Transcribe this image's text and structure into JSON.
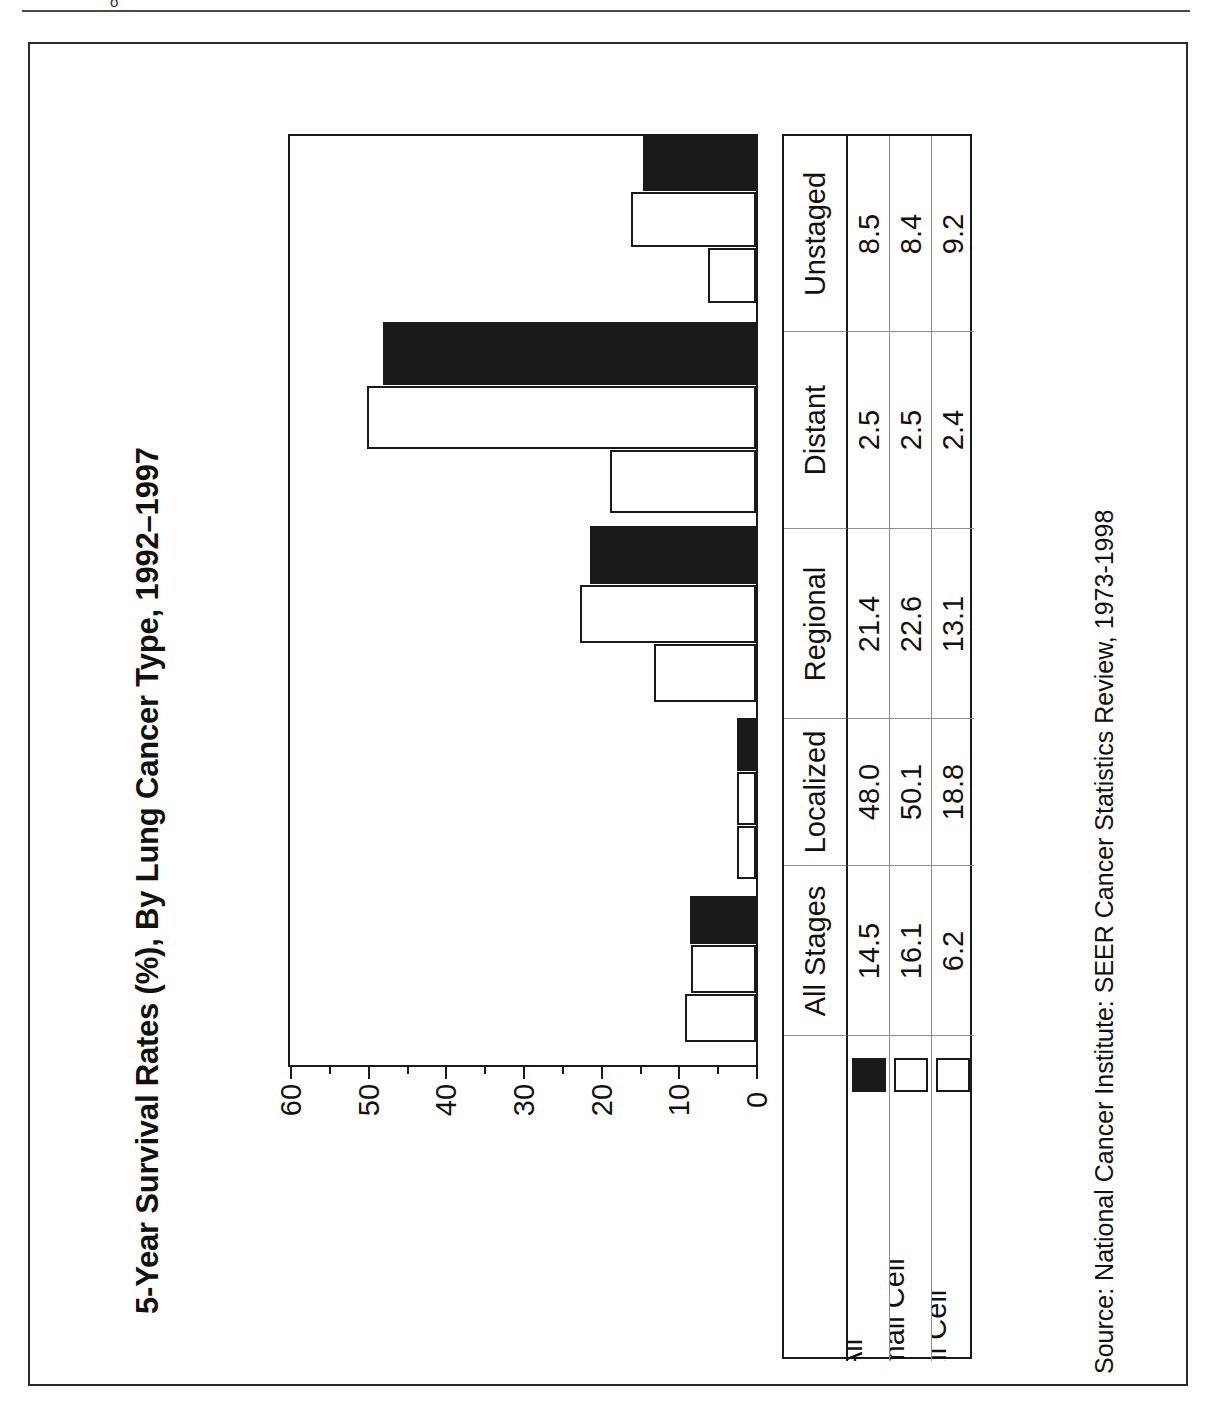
{
  "page": {
    "header_partial_text": "o",
    "background_color": "#ffffff",
    "frame_color": "#2b2b2b"
  },
  "chart_data": {
    "type": "bar",
    "orientation": "horizontal",
    "title": "5-Year Survival Rates (%), By Lung Cancer Type, 1992–1997",
    "xlabel": "",
    "ylabel": "",
    "categories": [
      "All Stages",
      "Localized",
      "Regional",
      "Distant",
      "Unstaged"
    ],
    "series": [
      {
        "name": "All",
        "fill": "solid",
        "color": "#1a1a1a",
        "values": [
          14.5,
          48.0,
          21.4,
          2.5,
          8.5
        ]
      },
      {
        "name": "Non-Small Cell",
        "fill": "hollow",
        "color": "#ffffff",
        "values": [
          16.1,
          50.1,
          22.6,
          2.5,
          8.4
        ]
      },
      {
        "name": "Small Cell",
        "fill": "hollow",
        "color": "#ffffff",
        "values": [
          6.2,
          18.8,
          13.1,
          2.4,
          9.2
        ]
      }
    ],
    "axis": {
      "ticks": [
        60,
        50,
        40,
        30,
        20,
        10,
        0
      ],
      "tick_labels": [
        "60",
        "50",
        "40",
        "30",
        "20",
        "10",
        "0"
      ],
      "minor_tick_step": 5,
      "range": [
        0,
        60
      ],
      "direction": "descending-left-to-right"
    },
    "grid": false,
    "legend_position": "table-row-headers",
    "source": "Source: National Cancer Institute: SEER Cancer Statistics Review, 1973-1998"
  },
  "table": {
    "corner_label": "",
    "column_headers": [
      "All Stages",
      "Localized",
      "Regional",
      "Distant",
      "Unstaged"
    ],
    "rows": [
      {
        "label": "All",
        "swatch": "solid",
        "values": [
          "14.5",
          "48.0",
          "21.4",
          "2.5",
          "8.5"
        ]
      },
      {
        "label": "Non-Small Cell",
        "swatch": "hollow",
        "values": [
          "16.1",
          "50.1",
          "22.6",
          "2.5",
          "8.4"
        ]
      },
      {
        "label": "Small Cell",
        "swatch": "hollow",
        "values": [
          "6.2",
          "18.8",
          "13.1",
          "2.4",
          "9.2"
        ]
      }
    ]
  },
  "source_note": "Source: National Cancer Institute: SEER Cancer Statistics Review, 1973-1998"
}
